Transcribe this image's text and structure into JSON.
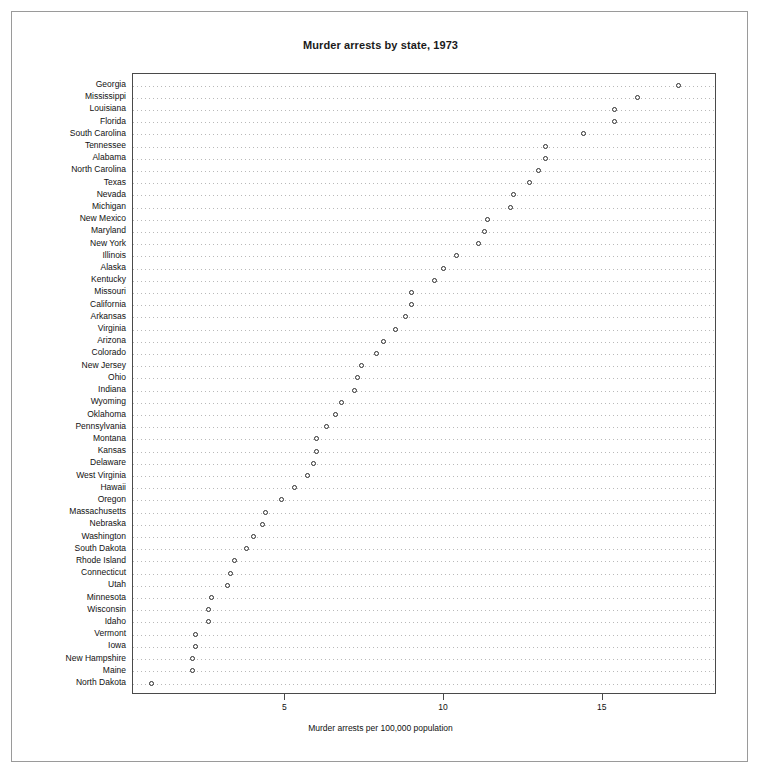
{
  "figure": {
    "title": "Murder arrests by state, 1973",
    "xaxis_title": "Murder arrests per 100,000 population"
  },
  "chart_data": {
    "type": "scatter",
    "subtype": "dot-plot",
    "title": "Murder arrests by state, 1973",
    "xlabel": "Murder arrests per 100,000 population",
    "ylabel": "",
    "orientation": "horizontal",
    "grid": true,
    "grid_axis": "y",
    "legend": false,
    "xlim": [
      0.2,
      18.6
    ],
    "xticks": [
      5,
      10,
      15
    ],
    "xticklabels": [
      "5",
      "10",
      "15"
    ],
    "marker": "open-circle",
    "marker_color": "#2b2b2b",
    "sort": "ascending-from-bottom",
    "categories": [
      "Georgia",
      "Mississippi",
      "Louisiana",
      "Florida",
      "South Carolina",
      "Tennessee",
      "Alabama",
      "North Carolina",
      "Texas",
      "Nevada",
      "Michigan",
      "New Mexico",
      "Maryland",
      "New York",
      "Illinois",
      "Alaska",
      "Kentucky",
      "Missouri",
      "California",
      "Arkansas",
      "Virginia",
      "Arizona",
      "Colorado",
      "New Jersey",
      "Ohio",
      "Indiana",
      "Wyoming",
      "Oklahoma",
      "Pennsylvania",
      "Montana",
      "Kansas",
      "Delaware",
      "West Virginia",
      "Hawaii",
      "Oregon",
      "Massachusetts",
      "Nebraska",
      "Washington",
      "South Dakota",
      "Rhode Island",
      "Connecticut",
      "Utah",
      "Minnesota",
      "Wisconsin",
      "Idaho",
      "Vermont",
      "Iowa",
      "New Hampshire",
      "Maine",
      "North Dakota"
    ],
    "values": [
      17.4,
      16.1,
      15.4,
      15.4,
      14.4,
      13.2,
      13.2,
      13.0,
      12.7,
      12.2,
      12.1,
      11.4,
      11.3,
      11.1,
      10.4,
      10.0,
      9.7,
      9.0,
      9.0,
      8.8,
      8.5,
      8.1,
      7.9,
      7.4,
      7.3,
      7.2,
      6.8,
      6.6,
      6.3,
      6.0,
      6.0,
      5.9,
      5.7,
      5.3,
      4.9,
      4.4,
      4.3,
      4.0,
      3.8,
      3.4,
      3.3,
      3.2,
      2.7,
      2.6,
      2.6,
      2.2,
      2.2,
      2.1,
      2.1,
      0.8
    ]
  }
}
